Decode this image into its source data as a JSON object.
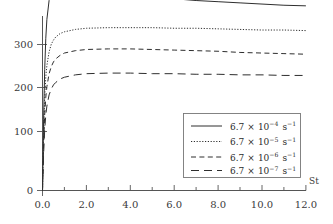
{
  "chart_data": {
    "type": "line",
    "title": "",
    "xlabel": "St",
    "ylabel": "",
    "xlim": [
      0.0,
      12.0
    ],
    "ylim": [
      0,
      350
    ],
    "grid": false,
    "legend_position": "inside-lower-right",
    "xticks": [
      "0.0",
      "2.0",
      "4.0",
      "6.0",
      "8.0",
      "10.0",
      "12.0"
    ],
    "xtick_values": [
      0.0,
      2.0,
      4.0,
      6.0,
      8.0,
      10.0,
      12.0
    ],
    "xminor_step": 1.0,
    "yticks": [
      "0",
      "100",
      "200",
      "300"
    ],
    "ytick_values": [
      0,
      100,
      200,
      300
    ],
    "x": [
      0.0,
      0.05,
      0.1,
      0.15,
      0.2,
      0.3,
      0.4,
      0.5,
      0.6,
      0.8,
      1.0,
      1.5,
      2.0,
      3.0,
      4.0,
      5.0,
      6.0,
      7.0,
      8.0,
      9.0,
      10.0,
      11.0,
      12.0
    ],
    "series": [
      {
        "name": "6.7 × 10⁻⁴ s⁻¹",
        "mantissa": "6.7",
        "base": "10",
        "exponent": "-4",
        "unit": "s",
        "unit_exponent": "-1",
        "style": "solid",
        "color": "#2e2e2e",
        "values": [
          0,
          120,
          205,
          258,
          290,
          322,
          332,
          335,
          336,
          337,
          337,
          336,
          335,
          333,
          330,
          327,
          325,
          322,
          320,
          318,
          316,
          314,
          313
        ]
      },
      {
        "name": "6.7 × 10⁻⁵ s⁻¹",
        "mantissa": "6.7",
        "base": "10",
        "exponent": "-5",
        "unit": "s",
        "unit_exponent": "-1",
        "style": "dotted",
        "color": "#2e2e2e",
        "values": [
          0,
          95,
          158,
          193,
          212,
          235,
          248,
          255,
          260,
          266,
          269,
          273,
          275,
          276,
          276,
          276,
          275,
          275,
          274,
          273,
          272,
          272,
          271
        ]
      },
      {
        "name": "6.7 × 10⁻⁶ s⁻¹",
        "mantissa": "6.7",
        "base": "10",
        "exponent": "-6",
        "unit": "s",
        "unit_exponent": "-1",
        "style": "dashed",
        "color": "#2e2e2e",
        "values": [
          0,
          78,
          128,
          158,
          176,
          198,
          210,
          218,
          223,
          229,
          233,
          237,
          239,
          240,
          240,
          239,
          238,
          237,
          236,
          234,
          233,
          232,
          231
        ]
      },
      {
        "name": "6.7 × 10⁻⁷ s⁻¹",
        "mantissa": "6.7",
        "base": "10",
        "exponent": "-7",
        "unit": "s",
        "unit_exponent": "-1",
        "style": "longdash",
        "color": "#2e2e2e",
        "values": [
          0,
          62,
          103,
          128,
          143,
          162,
          172,
          179,
          183,
          189,
          192,
          196,
          198,
          199,
          199,
          198,
          198,
          197,
          197,
          196,
          196,
          195,
          195
        ]
      }
    ]
  },
  "axis": {
    "x_label": "St",
    "y_label": ""
  },
  "legend": {
    "entries": [
      {
        "mantissa": "6.7",
        "times": "×",
        "base": "10",
        "exponent": "−4",
        "unit": "s",
        "unit_exp": "−1"
      },
      {
        "mantissa": "6.7",
        "times": "×",
        "base": "10",
        "exponent": "−5",
        "unit": "s",
        "unit_exp": "−1"
      },
      {
        "mantissa": "6.7",
        "times": "×",
        "base": "10",
        "exponent": "−6",
        "unit": "s",
        "unit_exp": "−1"
      },
      {
        "mantissa": "6.7",
        "times": "×",
        "base": "10",
        "exponent": "−7",
        "unit": "s",
        "unit_exp": "−1"
      }
    ]
  },
  "ticks": {
    "x": [
      {
        "label": "0.0"
      },
      {
        "label": "2.0"
      },
      {
        "label": "4.0"
      },
      {
        "label": "6.0"
      },
      {
        "label": "8.0"
      },
      {
        "label": "10.0"
      },
      {
        "label": "12.0"
      }
    ],
    "y": [
      {
        "label": "0"
      },
      {
        "label": "100"
      },
      {
        "label": "200"
      },
      {
        "label": "300"
      }
    ]
  },
  "colors": {
    "background": "#ffffff",
    "axis": "#555555",
    "curve": "#2e2e2e",
    "text": "#3a3a3a",
    "legend_border": "#777777"
  }
}
